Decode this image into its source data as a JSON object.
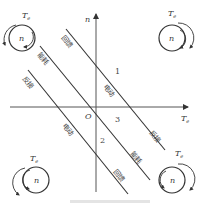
{
  "diagram": {
    "axes": {
      "x_label": "Te",
      "x_label_sub": "e",
      "y_label": "n",
      "origin_label": "O"
    },
    "line_numbers": [
      "1",
      "2",
      "3"
    ],
    "regions": {
      "upper_left": [
        "回馈",
        "能耗",
        "反接"
      ],
      "line1_mid": "电动",
      "line2_mid": "电动",
      "lower_right": [
        "反接",
        "能耗",
        "回馈"
      ]
    },
    "quadrant_icons": [
      {
        "pos": "top-left",
        "torque": "T",
        "torque_sub": "e",
        "speed": "n"
      },
      {
        "pos": "top-right",
        "torque": "T",
        "torque_sub": "e",
        "speed": "n"
      },
      {
        "pos": "bottom-left",
        "torque": "T",
        "torque_sub": "e",
        "speed": "n"
      },
      {
        "pos": "bottom-right",
        "torque": "T",
        "torque_sub": "e",
        "speed": "n"
      }
    ],
    "colors": {
      "line": "#333333",
      "text": "#444444"
    }
  }
}
